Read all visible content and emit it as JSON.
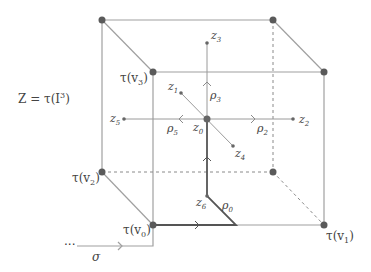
{
  "title_label": {
    "text": "Z = τ(I",
    "sup": "3",
    "close": ")"
  },
  "colors": {
    "edge": "#9a9a9a",
    "vertex": "#5a5a5a",
    "path": "#555555",
    "text": "#444444",
    "dashed": "#8a8a8a"
  },
  "vertices": [
    {
      "id": "back-top-left",
      "x": 102,
      "y": 20,
      "label": ""
    },
    {
      "id": "back-top-right",
      "x": 273,
      "y": 20,
      "label": ""
    },
    {
      "id": "v3",
      "x": 153,
      "y": 72,
      "label": "τ(v",
      "sub": "3",
      "close": ")"
    },
    {
      "id": "front-top-right",
      "x": 324,
      "y": 72,
      "label": ""
    },
    {
      "id": "v2",
      "x": 102,
      "y": 172,
      "label": "τ(v",
      "sub": "2",
      "close": ")"
    },
    {
      "id": "back-bottom-right",
      "x": 273,
      "y": 172,
      "label": ""
    },
    {
      "id": "v0",
      "x": 153,
      "y": 225,
      "label": "τ(v",
      "sub": "0",
      "close": ")"
    },
    {
      "id": "v1",
      "x": 324,
      "y": 225,
      "label": "τ(v",
      "sub": "1",
      "close": ")"
    }
  ],
  "points": [
    {
      "id": "z0",
      "base": "z",
      "sub": "0",
      "x": 207,
      "y": 119
    },
    {
      "id": "z1",
      "base": "z",
      "sub": "1",
      "x": 181,
      "y": 93
    },
    {
      "id": "z2",
      "base": "z",
      "sub": "2",
      "x": 293,
      "y": 119
    },
    {
      "id": "z3",
      "base": "z",
      "sub": "3",
      "x": 207,
      "y": 43
    },
    {
      "id": "z4",
      "base": "z",
      "sub": "4",
      "x": 233,
      "y": 146
    },
    {
      "id": "z5",
      "base": "z",
      "sub": "5",
      "x": 124,
      "y": 119
    },
    {
      "id": "z6",
      "base": "z",
      "sub": "6",
      "x": 207,
      "y": 196
    }
  ],
  "paths": [
    {
      "id": "rho0",
      "base": "ρ",
      "sub": "0"
    },
    {
      "id": "rho2",
      "base": "ρ",
      "sub": "2"
    },
    {
      "id": "rho3",
      "base": "ρ",
      "sub": "3"
    },
    {
      "id": "rho5",
      "base": "ρ",
      "sub": "5"
    }
  ],
  "sigma": {
    "label": "σ",
    "dots": "···"
  }
}
